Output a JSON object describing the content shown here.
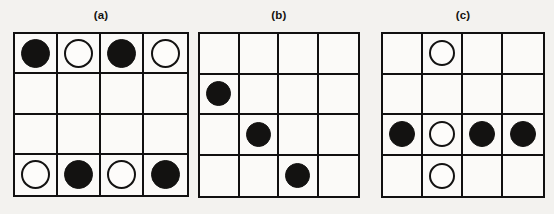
{
  "figure": {
    "background_color": "#f3f2ef",
    "ink_color": "#131211",
    "paper_color": "#fbfaf8"
  },
  "panels": [
    {
      "id": "a",
      "label": "(a)",
      "rows": 4,
      "cols": 4,
      "grid": [
        [
          "filled",
          "open",
          "filled",
          "open"
        ],
        [
          "empty",
          "empty",
          "empty",
          "empty"
        ],
        [
          "empty",
          "empty",
          "empty",
          "empty"
        ],
        [
          "open",
          "filled",
          "open",
          "filled"
        ]
      ]
    },
    {
      "id": "b",
      "label": "(b)",
      "rows": 4,
      "cols": 4,
      "grid": [
        [
          "empty",
          "empty",
          "empty",
          "empty"
        ],
        [
          "filled",
          "empty",
          "empty",
          "empty"
        ],
        [
          "empty",
          "filled",
          "empty",
          "empty"
        ],
        [
          "empty",
          "empty",
          "filled",
          "empty"
        ]
      ]
    },
    {
      "id": "c",
      "label": "(c)",
      "rows": 4,
      "cols": 4,
      "grid": [
        [
          "empty",
          "open",
          "empty",
          "empty"
        ],
        [
          "empty",
          "empty",
          "empty",
          "empty"
        ],
        [
          "filled",
          "open",
          "filled",
          "filled"
        ],
        [
          "empty",
          "open",
          "empty",
          "empty"
        ]
      ]
    }
  ]
}
